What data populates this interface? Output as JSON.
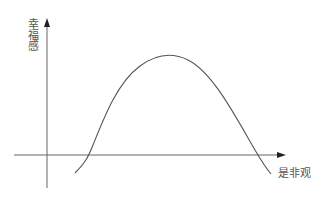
{
  "diagram": {
    "type": "curve-sketch",
    "y_axis": {
      "label": "幸福感"
    },
    "x_axis": {
      "label": "是非观"
    },
    "curve": {
      "shape": "inverted-U",
      "stroke": "#555555"
    },
    "axis_color": "#555555"
  }
}
